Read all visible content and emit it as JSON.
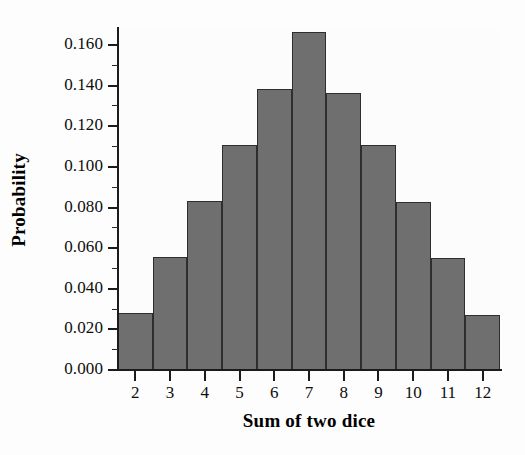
{
  "chart_data": {
    "type": "bar",
    "title": "",
    "subtitle": "",
    "xlabel": "Sum of two dice",
    "ylabel": "Probability",
    "categories": [
      "2",
      "3",
      "4",
      "5",
      "6",
      "7",
      "8",
      "9",
      "10",
      "11",
      "12"
    ],
    "values": [
      0.028,
      0.0556,
      0.0832,
      0.111,
      0.1386,
      0.1664,
      0.1365,
      0.1106,
      0.0828,
      0.0551,
      0.0273
    ],
    "series": [
      {
        "name": "Probability",
        "values": [
          0.028,
          0.0556,
          0.0832,
          0.111,
          0.1386,
          0.1664,
          0.1365,
          0.1106,
          0.0828,
          0.0551,
          0.0273
        ]
      }
    ],
    "xlim": [
      1.5,
      12.5
    ],
    "ylim": [
      0.0,
      0.1684
    ],
    "ytick_labels": [
      "0.000",
      "0.020",
      "0.040",
      "0.060",
      "0.080",
      "0.100",
      "0.120",
      "0.140",
      "0.160"
    ],
    "ytick_values": [
      0.0,
      0.02,
      0.04,
      0.06,
      0.08,
      0.1,
      0.12,
      0.14,
      0.16
    ],
    "yminor_tick_values": [
      0.01,
      0.03,
      0.05,
      0.07,
      0.09,
      0.11,
      0.13,
      0.15
    ],
    "xtick_labels": [
      "2",
      "3",
      "4",
      "5",
      "6",
      "7",
      "8",
      "9",
      "10",
      "11",
      "12"
    ],
    "grid": false,
    "legend": null,
    "legend_position": "none",
    "bar_fill_color": "#6f6f6f",
    "bar_edge_color": "#2e2e2e",
    "axis_color": "#1b1b1b",
    "background_color": "#fcfcfc",
    "annotations": []
  },
  "axes": {
    "x_title": "Sum of two dice",
    "y_title": "Probability"
  }
}
